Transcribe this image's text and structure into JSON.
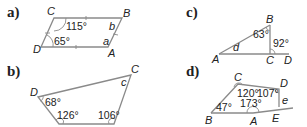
{
  "problems": [
    {
      "label": "a)",
      "shape": "parallelogram",
      "vertices": {
        "C": "C",
        "B": "B",
        "D": "D",
        "A": "A"
      },
      "angles": {
        "C": "115°",
        "D": "65°"
      },
      "unknowns": {
        "B": "b",
        "A": "a"
      }
    },
    {
      "label": "c)",
      "shape": "right-triangle-with-extension",
      "vertices": {
        "B": "B",
        "A": "A",
        "C": "C",
        "D": "D"
      },
      "angles": {
        "B": "63°",
        "exterior_C": "92°"
      },
      "unknowns": {
        "A": "d"
      }
    },
    {
      "label": "b)",
      "shape": "quadrilateral",
      "vertices": {
        "D": "D",
        "C": "C"
      },
      "angles": {
        "D": "68°",
        "bottom_left": "126°",
        "bottom_right": "106°"
      },
      "unknowns": {
        "C": "c"
      }
    },
    {
      "label": "d)",
      "shape": "pentagon-with-extension",
      "vertices": {
        "C": "C",
        "D": "D",
        "B": "B",
        "A": "A",
        "E": "E"
      },
      "angles": {
        "C": "120°",
        "D": "107°",
        "A": "173°",
        "B": "47°"
      },
      "unknowns": {
        "E": "e"
      }
    }
  ]
}
